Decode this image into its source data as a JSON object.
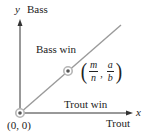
{
  "diagram": {
    "axes": {
      "x_variable": "x",
      "x_label": "Trout",
      "y_variable": "y",
      "y_label": "Bass"
    },
    "regions": {
      "upper": "Bass win",
      "lower": "Trout win"
    },
    "points": {
      "origin": {
        "label": "(0, 0)"
      },
      "ratio_point": {
        "open": "(",
        "x_num": "m",
        "x_den": "n",
        "separator": ",",
        "y_num": "a",
        "y_den": "b",
        "close": ")"
      }
    },
    "colors": {
      "axis": "#333333",
      "diagonal": "#9a9a9a",
      "point_ring": "#b5b5b5",
      "point_dot": "#555555",
      "text": "#222222"
    }
  }
}
